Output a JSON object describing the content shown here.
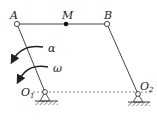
{
  "diagram": {
    "type": "four-bar linkage",
    "points": {
      "A": {
        "label": "A"
      },
      "M": {
        "label": "M"
      },
      "B": {
        "label": "B"
      },
      "O1": {
        "label": "O",
        "subscript": "1"
      },
      "O2": {
        "label": "O",
        "subscript": "2"
      }
    },
    "annotations": {
      "alpha": "α",
      "omega": "ω"
    },
    "colors": {
      "line": "#444444",
      "text": "#222222"
    }
  }
}
